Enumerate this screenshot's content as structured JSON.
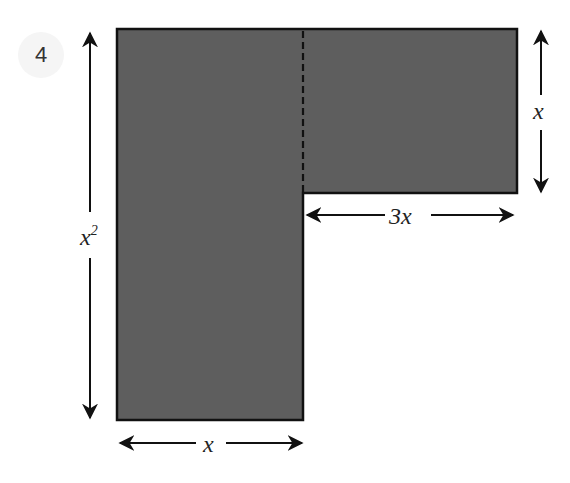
{
  "problem_number": "4",
  "colors": {
    "shape_fill": "#5e5e5e",
    "shape_stroke": "#111111",
    "arrow": "#111111",
    "badge_bg": "#f5f5f5"
  },
  "labels": {
    "left_height": {
      "base": "x",
      "exponent": "2"
    },
    "right_height": "x",
    "top_arm_width": "3x",
    "bottom_width": "x"
  }
}
